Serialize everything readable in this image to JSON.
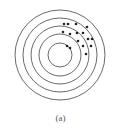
{
  "figure": {
    "caption": "(a)",
    "target": {
      "center": [
        60,
        55
      ],
      "ring_radii": [
        45,
        37,
        29,
        21,
        12
      ],
      "ring_color": "#6a6a6a",
      "ring_width": 1
    },
    "dots": {
      "color": "#222222",
      "radius": 1.3,
      "points": [
        [
          64,
          24
        ],
        [
          68,
          24
        ],
        [
          76,
          24
        ],
        [
          87,
          27
        ],
        [
          63,
          32
        ],
        [
          70,
          34
        ],
        [
          77,
          33
        ],
        [
          83,
          33
        ],
        [
          88,
          39
        ],
        [
          92,
          39
        ],
        [
          78,
          41
        ],
        [
          83,
          46
        ],
        [
          91,
          46
        ],
        [
          67,
          46
        ],
        [
          70,
          48
        ],
        [
          86,
          54
        ]
      ]
    }
  }
}
